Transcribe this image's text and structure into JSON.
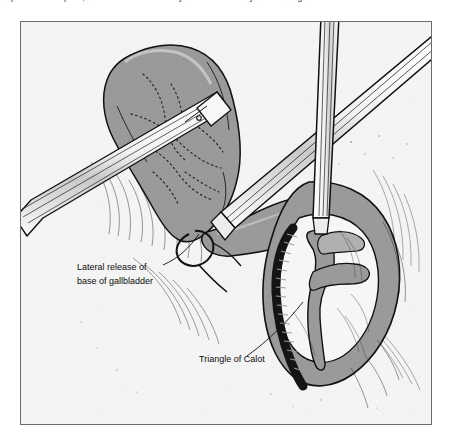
{
  "caption": {
    "text": "exposure is adequate, confirm and control the cystic duct and artery in the Triangle"
  },
  "figure": {
    "background_color": "#f4f4f4",
    "frame_color": "#6b6b6b",
    "ink_color": "#111111",
    "organ_fill": "#9a9a9a",
    "organ_fill_light": "#b4b4b4",
    "organ_fill_dark": "#7d7d7d",
    "vessel_color": "#141414",
    "instrument_fill": "#fbfbfb"
  },
  "annotations": [
    {
      "id": "lateral-release",
      "line1": "Lateral release of",
      "line2": "base of gallbladder"
    },
    {
      "id": "triangle-calot",
      "line1": "Triangle of Calot"
    }
  ],
  "structures": {
    "gallbladder": "gallbladder",
    "cystic_artery": "cystic-artery",
    "cystic_duct": "cystic-duct",
    "liver_bed": "liver-bed",
    "grasper_left": "laparoscopic-grasper",
    "dissector_right": "laparoscopic-dissector",
    "retractor_shaft": "retractor-shaft"
  }
}
